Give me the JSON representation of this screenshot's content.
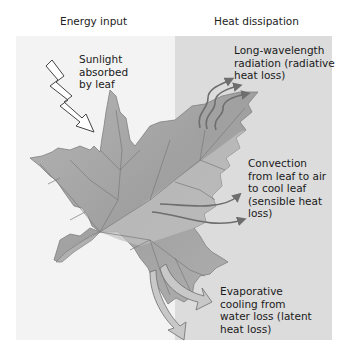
{
  "headers": {
    "left": "Energy input",
    "right": "Heat dissipation"
  },
  "labels": {
    "sunlight": "Sunlight\nabsorbed\nby leaf",
    "radiation": "Long-wavelength\nradiation (radiative\nheat loss)",
    "convection": "Convection\nfrom leaf to air\nto cool leaf\n(sensible heat\nloss)",
    "evaporation": "Evaporative\ncooling from\nwater loss (latent\nheat loss)"
  },
  "colors": {
    "left_panel": "#f3f3f3",
    "right_panel": "#dcdcdc",
    "leaf_fill": "#a8a8a8",
    "leaf_vein": "#7a7a7a",
    "arrow_fill": "#c4c4c4",
    "arrow_stroke": "#6e6e6e"
  }
}
